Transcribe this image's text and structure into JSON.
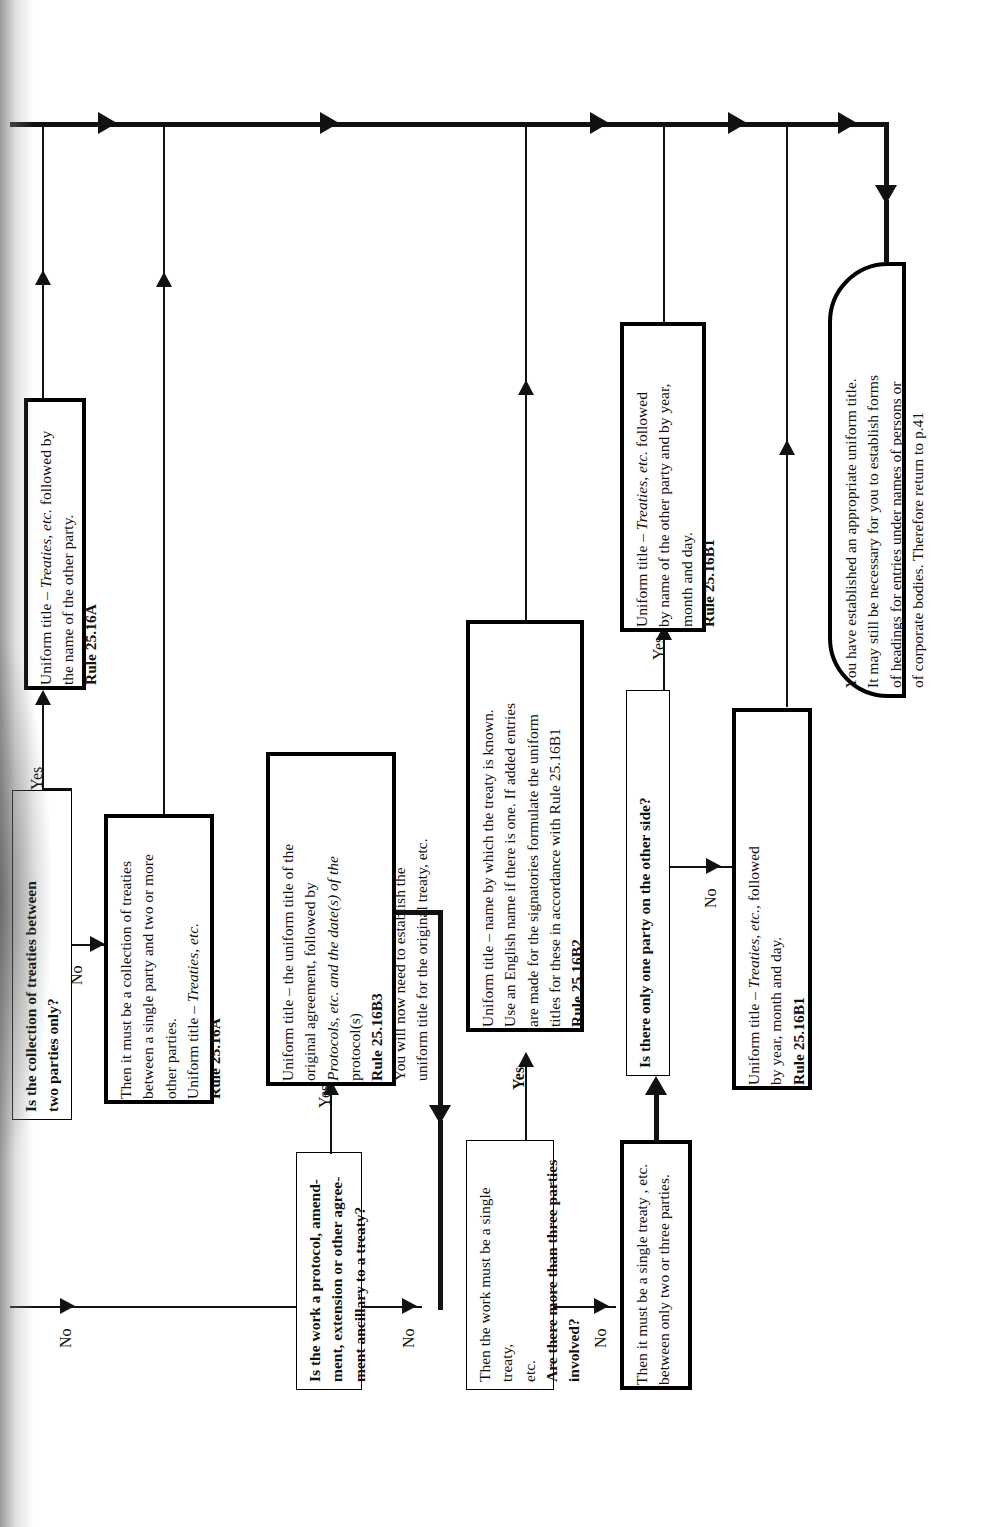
{
  "diagram": {
    "orientation": "rotated-90-ccw",
    "page_reference": "p.41",
    "nodes": [
      {
        "id": "q-collection-two-parties",
        "kind": "decision",
        "text_plain": "Is the collection of treaties between two parties only?",
        "line1": "Is the collection of treaties between",
        "line2": "two parties only?"
      },
      {
        "id": "out-collection-two-parties",
        "kind": "terminal",
        "line1": "Uniform title – Treaties, etc. followed by",
        "line2": "the name of the other party.",
        "rule": "Rule 25.16A"
      },
      {
        "id": "out-collection-multi",
        "kind": "terminal",
        "line1": "Then it must be a collection of treaties",
        "line2": "between a single party and two or more",
        "line3": "other parties.",
        "line4": "Uniform title – Treaties, etc.",
        "rule": "Rule 25.16A"
      },
      {
        "id": "q-protocol",
        "kind": "decision",
        "line1": "Is the work a protocol, amend-",
        "line2": "ment, extension or other agree-",
        "line3": "ment ancillary to a treaty?"
      },
      {
        "id": "out-protocol",
        "kind": "terminal",
        "line1": "Uniform title – the uniform title of the",
        "line2": "original agreement, followed by",
        "line3": "Protocols, etc. and the date(s) of the",
        "line4": "protocol(s)",
        "rule": "Rule 25.16B3",
        "line5": "You will now need to establish the",
        "line6": "uniform title for the original treaty, etc."
      },
      {
        "id": "q-more-than-three",
        "kind": "decision",
        "line1": "Then the work must be a single treaty,",
        "line2": "etc.",
        "line3": "Are there more than three parties",
        "line4": "involved?"
      },
      {
        "id": "out-many-parties",
        "kind": "terminal",
        "line1": "Uniform title – name by which the treaty is known.",
        "line2": "Use an English name if there is one. If added entries",
        "line3": "are made for the signatories formulate the uniform",
        "line4": "titles for these in accordance with Rule 25.16B1",
        "rule": "Rule 25.16B2"
      },
      {
        "id": "q-one-party-other-side",
        "kind": "decision",
        "line1": "Then it must be a single treaty , etc.",
        "line2": "between only two or three parties.",
        "question": "Is there only one party on the other side?"
      },
      {
        "id": "state-two-or-three",
        "kind": "terminal",
        "line1": "Then it must be a single treaty , etc.",
        "line2": "between only two or three parties."
      },
      {
        "id": "q-one-party",
        "kind": "decision",
        "line1": "Is there only one party on the other side?"
      },
      {
        "id": "out-one-party",
        "kind": "terminal",
        "line1": "Uniform title – Treaties, etc. followed",
        "line2": "by name of the other party and by year,",
        "line3": "month and day.",
        "rule": "Rule 25.16B1"
      },
      {
        "id": "out-two-or-three-parties",
        "kind": "terminal",
        "line1": "Uniform title – Treaties, etc., followed",
        "line2": "by year, month and day.",
        "rule": "Rule 25.16B1"
      },
      {
        "id": "end-established",
        "kind": "terminal-rounded",
        "line1": "You have established an appropriate uniform title.",
        "line2": "It may still be necessary for you to establish forms",
        "line3": "of headings for entries under names of persons or",
        "line4": "of corporate bodies. Therefore return to p.41"
      }
    ],
    "edge_labels": {
      "yes": "Yes",
      "no": "No"
    },
    "edges": [
      {
        "from": "q-collection-two-parties",
        "to": "out-collection-two-parties",
        "label": "Yes"
      },
      {
        "from": "q-collection-two-parties",
        "to": "out-collection-multi",
        "label": "No"
      },
      {
        "from": "entry",
        "to": "q-protocol",
        "label": "No"
      },
      {
        "from": "q-protocol",
        "to": "out-protocol",
        "label": "Yes"
      },
      {
        "from": "q-protocol",
        "to": "q-more-than-three",
        "label": "No"
      },
      {
        "from": "q-more-than-three",
        "to": "out-many-parties",
        "label": "Yes"
      },
      {
        "from": "q-more-than-three",
        "to": "state-two-or-three",
        "label": "No"
      },
      {
        "from": "state-two-or-three",
        "to": "q-one-party",
        "label": ""
      },
      {
        "from": "q-one-party",
        "to": "out-one-party",
        "label": "Yes"
      },
      {
        "from": "q-one-party",
        "to": "out-two-or-three-parties",
        "label": "No"
      },
      {
        "from": "all-outcomes",
        "to": "end-established",
        "label": ""
      }
    ],
    "colors": {
      "ink": "#111111",
      "paper": "#ffffff"
    }
  }
}
